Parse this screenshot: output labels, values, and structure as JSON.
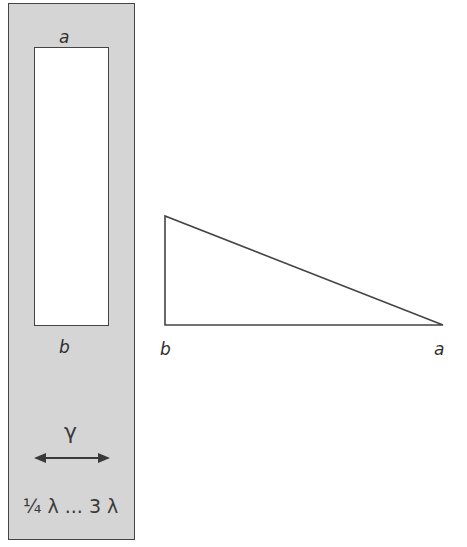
{
  "panel": {
    "fill_color": "#d5d5d5",
    "window_top_label": "a",
    "window_bottom_label": "b",
    "wave_symbol": "γ",
    "range_label": "¼ λ ... 3 λ"
  },
  "triangle": {
    "vertices": [
      [
        165,
        216
      ],
      [
        165,
        325
      ],
      [
        443,
        325
      ]
    ],
    "left_label": "b",
    "right_label": "a"
  }
}
